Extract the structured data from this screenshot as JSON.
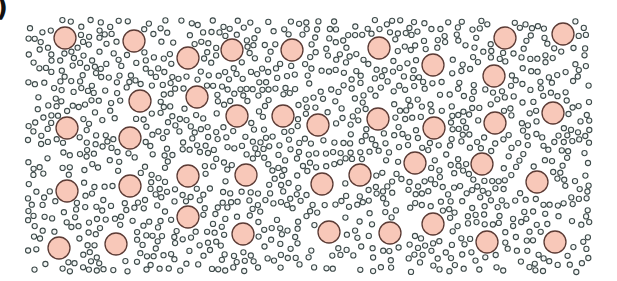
{
  "panel_label": ")",
  "canvas": {
    "width": 617,
    "height": 281
  },
  "region": {
    "x0": 28,
    "y0": 20,
    "x1": 590,
    "y1": 272
  },
  "colors": {
    "large_fill": "#f8c8b9",
    "large_stroke": "#5b3b35",
    "small_fill": "#f4f7f6",
    "small_stroke": "#3e4a4a",
    "background": "#ffffff"
  },
  "large_particles": {
    "radius": 11,
    "centers": [
      [
        65,
        38
      ],
      [
        134,
        41
      ],
      [
        188,
        58
      ],
      [
        232,
        50
      ],
      [
        292,
        50
      ],
      [
        379,
        48
      ],
      [
        433,
        65
      ],
      [
        505,
        38
      ],
      [
        563,
        34
      ],
      [
        494,
        76
      ],
      [
        140,
        101
      ],
      [
        197,
        97
      ],
      [
        67,
        128
      ],
      [
        130,
        138
      ],
      [
        237,
        116
      ],
      [
        283,
        116
      ],
      [
        318,
        125
      ],
      [
        378,
        119
      ],
      [
        434,
        128
      ],
      [
        495,
        123
      ],
      [
        553,
        113
      ],
      [
        67,
        191
      ],
      [
        130,
        186
      ],
      [
        188,
        176
      ],
      [
        246,
        175
      ],
      [
        322,
        184
      ],
      [
        360,
        175
      ],
      [
        415,
        163
      ],
      [
        482,
        164
      ],
      [
        537,
        182
      ],
      [
        188,
        217
      ],
      [
        243,
        234
      ],
      [
        59,
        248
      ],
      [
        116,
        244
      ],
      [
        329,
        232
      ],
      [
        390,
        233
      ],
      [
        433,
        224
      ],
      [
        487,
        242
      ],
      [
        555,
        242
      ]
    ]
  },
  "small_particles": {
    "radius": 2.6,
    "count": 1150,
    "seed": 7
  }
}
